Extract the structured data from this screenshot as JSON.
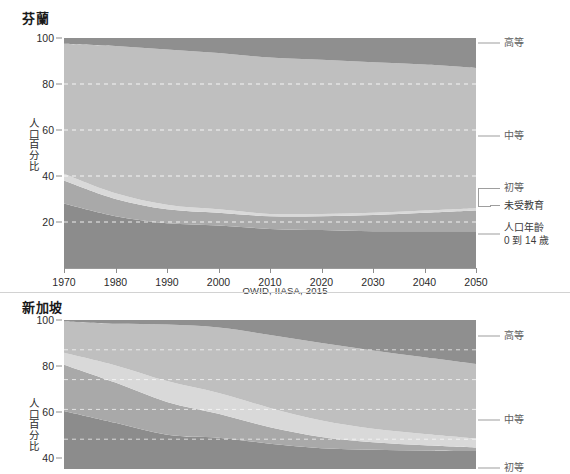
{
  "source_note": "OWID, IIASA, 2015",
  "axis": {
    "ylabel": "人口百分比",
    "yticks": [
      100,
      80,
      60,
      40,
      20
    ],
    "xticks": [
      1970,
      1980,
      1990,
      2000,
      2010,
      2020,
      2030,
      2040,
      2050
    ]
  },
  "series_labels": {
    "tertiary": "高等",
    "secondary": "中等",
    "primary": "初等",
    "no_education": "未受教育",
    "age_0_14_line1": "人口年齡",
    "age_0_14_line2": "0 到 14 歲"
  },
  "colors": {
    "tertiary": "#8f8f8f",
    "secondary": "#bfbfbf",
    "primary": "#d9d9d9",
    "no_education": "#a9a9a9",
    "age_0_14": "#8c8c8c",
    "gridline": "#ffffff",
    "axis": "#9a9a9a",
    "text": "#2b2b2b",
    "label_text": "#5e5e5e"
  },
  "charts": [
    {
      "id": "finland",
      "title": "芬蘭",
      "show_xaxis": true,
      "show_source": true
    },
    {
      "id": "singapore",
      "title": "新加坡",
      "show_xaxis": false,
      "show_source": false
    }
  ],
  "chart_data": [
    {
      "type": "area",
      "title": "芬蘭",
      "xlabel": "",
      "ylabel": "人口百分比",
      "xlim": [
        1970,
        2050
      ],
      "ylim": [
        0,
        100
      ],
      "grid": true,
      "legend_position": "right",
      "stacked": true,
      "stack_order_bottom_to_top": [
        "人口年齡 0 到 14 歲",
        "未受教育",
        "初等",
        "中等",
        "高等"
      ],
      "x": [
        1970,
        1980,
        1990,
        2000,
        2010,
        2020,
        2030,
        2040,
        2050
      ],
      "series": [
        {
          "name": "人口年齡 0 到 14 歲",
          "values": [
            28.0,
            22.5,
            19.5,
            18.5,
            17.0,
            16.5,
            16.0,
            16.0,
            16.0
          ]
        },
        {
          "name": "未受教育",
          "values": [
            10.0,
            7.5,
            6.0,
            5.5,
            5.5,
            6.0,
            7.0,
            8.0,
            9.0
          ]
        },
        {
          "name": "初等",
          "values": [
            3.0,
            2.5,
            2.0,
            1.5,
            1.0,
            1.0,
            1.0,
            1.0,
            1.0
          ]
        },
        {
          "name": "中等",
          "values": [
            56.5,
            64.0,
            67.5,
            68.0,
            68.0,
            67.0,
            65.5,
            63.5,
            61.0
          ]
        },
        {
          "name": "高等",
          "values": [
            2.5,
            3.5,
            5.0,
            6.5,
            8.5,
            9.5,
            10.5,
            11.5,
            13.0
          ]
        }
      ]
    },
    {
      "type": "area",
      "title": "新加坡",
      "xlabel": "",
      "ylabel": "人口百分比",
      "xlim": [
        1970,
        2050
      ],
      "ylim": [
        0,
        100
      ],
      "grid": true,
      "legend_position": "right",
      "stacked": true,
      "stack_order_bottom_to_top": [
        "人口年齡 0 到 14 歲",
        "未受教育",
        "初等",
        "中等",
        "高等"
      ],
      "x": [
        1970,
        1980,
        1990,
        2000,
        2010,
        2020,
        2030,
        2040,
        2050
      ],
      "series": [
        {
          "name": "人口年齡 0 到 14 歲",
          "values": [
            39.0,
            31.0,
            23.0,
            21.0,
            17.0,
            14.0,
            13.0,
            12.5,
            12.0
          ]
        },
        {
          "name": "未受教育",
          "values": [
            31.0,
            27.0,
            22.0,
            16.0,
            11.0,
            7.5,
            5.0,
            3.5,
            2.5
          ]
        },
        {
          "name": "初等",
          "values": [
            8.0,
            11.5,
            14.0,
            14.0,
            13.0,
            11.0,
            9.0,
            7.5,
            6.0
          ]
        },
        {
          "name": "中等",
          "values": [
            21.0,
            28.0,
            38.0,
            44.0,
            49.0,
            52.0,
            52.5,
            51.5,
            50.0
          ]
        },
        {
          "name": "高等",
          "values": [
            1.0,
            2.5,
            3.0,
            5.0,
            10.0,
            15.5,
            20.5,
            25.0,
            29.5
          ]
        }
      ]
    }
  ]
}
